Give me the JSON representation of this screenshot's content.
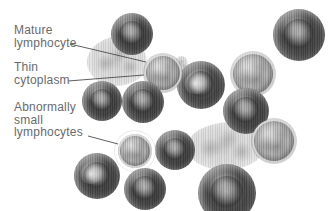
{
  "figure": {
    "colors": {
      "background": "#ffffff",
      "label_text": "#6a6a6a",
      "leader_line": "#4c4c4c"
    },
    "labels": [
      {
        "id": "mature-lymphocyte",
        "text_lines": [
          "Mature",
          "lymphocyte"
        ],
        "leader": {
          "x1": 70,
          "y1": 44,
          "x2": 146,
          "y2": 62
        }
      },
      {
        "id": "thin-cytoplasm",
        "text_lines": [
          "Thin",
          "cytoplasm"
        ],
        "leader": {
          "x1": 68,
          "y1": 81,
          "x2": 144,
          "y2": 75
        }
      },
      {
        "id": "abnormally-small-lymphocytes",
        "text_lines": [
          "Abnormally",
          "small",
          "lymphocytes"
        ],
        "leader": {
          "x1": 88,
          "y1": 136,
          "x2": 118,
          "y2": 144
        }
      }
    ],
    "cells": [
      {
        "name": "cytoplasm-mass-upper",
        "type": "mass",
        "cx": 117,
        "cy": 61,
        "rx": 30,
        "ry": 25,
        "z": 1
      },
      {
        "name": "cytoplasm-mass-lower",
        "type": "mass",
        "cx": 225,
        "cy": 146,
        "rx": 38,
        "ry": 24,
        "z": 1
      },
      {
        "name": "cytoplasm-lump-small",
        "type": "mass",
        "cx": 181,
        "cy": 64,
        "rx": 7,
        "ry": 8,
        "z": 1
      },
      {
        "name": "rbc-top-center",
        "type": "rbc",
        "cx": 132,
        "cy": 34,
        "rx": 21,
        "ry": 21,
        "z": 3
      },
      {
        "name": "rbc-top-right",
        "type": "rbc",
        "cx": 299,
        "cy": 35,
        "rx": 26,
        "ry": 26,
        "z": 2
      },
      {
        "name": "mature-lymphocyte-cell",
        "type": "lymph",
        "cx": 163,
        "cy": 73,
        "rx": 19,
        "ry": 19,
        "z": 3
      },
      {
        "name": "textured-cell-right-upper",
        "type": "lymph",
        "cx": 253,
        "cy": 74,
        "rx": 22,
        "ry": 22,
        "z": 2
      },
      {
        "name": "cell-center-right",
        "type": "rbc",
        "cx": 201,
        "cy": 85,
        "rx": 24,
        "ry": 24,
        "z": 2,
        "variant": "mottled"
      },
      {
        "name": "rbc-mid-left",
        "type": "rbc",
        "cx": 102,
        "cy": 101,
        "rx": 20,
        "ry": 20,
        "z": 2
      },
      {
        "name": "rbc-mid-center",
        "type": "rbc",
        "cx": 143,
        "cy": 102,
        "rx": 21,
        "ry": 21,
        "z": 4
      },
      {
        "name": "rbc-right",
        "type": "rbc",
        "cx": 246,
        "cy": 111,
        "rx": 23,
        "ry": 23,
        "z": 3
      },
      {
        "name": "abnormally-small-lymphocyte-cell",
        "type": "lymph",
        "cx": 135,
        "cy": 151,
        "rx": 17,
        "ry": 17,
        "z": 3,
        "variant": "halo"
      },
      {
        "name": "rbc-center",
        "type": "rbc",
        "cx": 175,
        "cy": 150,
        "rx": 20,
        "ry": 20,
        "z": 2
      },
      {
        "name": "rbc-bottom-left",
        "type": "rbc",
        "cx": 97,
        "cy": 176,
        "rx": 23,
        "ry": 23,
        "z": 3,
        "variant": "mottled"
      },
      {
        "name": "rbc-bottom-center",
        "type": "rbc",
        "cx": 145,
        "cy": 189,
        "rx": 21,
        "ry": 21,
        "z": 4
      },
      {
        "name": "rbc-bottom-right-large",
        "type": "rbc",
        "cx": 227,
        "cy": 193,
        "rx": 29,
        "ry": 29,
        "z": 3
      },
      {
        "name": "textured-cell-right-lower",
        "type": "lymph",
        "cx": 274,
        "cy": 141,
        "rx": 22,
        "ry": 22,
        "z": 4
      }
    ]
  }
}
